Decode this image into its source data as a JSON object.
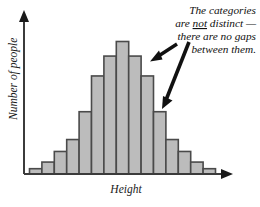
{
  "figure": {
    "axis_x_label": "Height",
    "axis_y_label": "Number of people",
    "annotation": {
      "line1": "The categories",
      "line2_pre": "are ",
      "line2_emph": "not",
      "line2_post": " distinct —",
      "line3": "there are no gaps",
      "line4": "between them."
    },
    "colors": {
      "bar_fill": "#bcbcbc",
      "bar_stroke": "#4a4a4a",
      "axis": "#3b3b3b",
      "text": "#111111",
      "background": "#ffffff"
    }
  },
  "chart_data": {
    "type": "bar",
    "title": "",
    "subtitle": "",
    "xlabel": "Height",
    "ylabel": "Number of people",
    "grid": false,
    "legend": null,
    "bar_gap": 0,
    "note": "Histogram of heights: bell-shaped, adjacent bars with no gaps between categories.",
    "categories": [
      "b1",
      "b2",
      "b3",
      "b4",
      "b5",
      "b6",
      "b7",
      "b8",
      "b9",
      "b10",
      "b11",
      "b12",
      "b13",
      "b14",
      "b15"
    ],
    "values": [
      4,
      9,
      17,
      26,
      47,
      74,
      89,
      100,
      89,
      74,
      47,
      26,
      17,
      9,
      4
    ],
    "ylim": [
      0,
      100
    ],
    "xlim": [
      0,
      15
    ],
    "annotations": [
      {
        "text": "The categories are not distinct — there are no gaps between them.",
        "emphasis": "not",
        "points_to": [
          "bar-boundary-9-10",
          "bar-boundary-10-11"
        ]
      }
    ]
  }
}
